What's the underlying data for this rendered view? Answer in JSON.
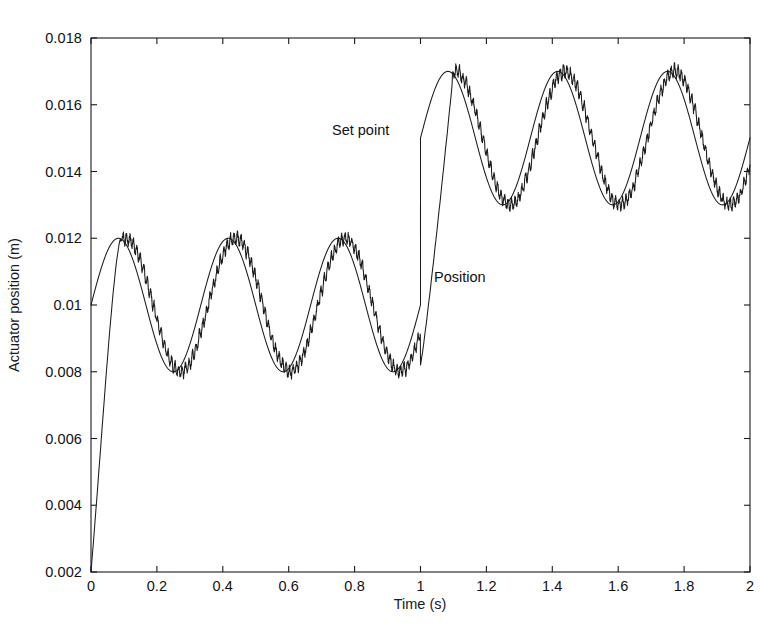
{
  "figure": {
    "background": "#ffffff",
    "ink_color": "#1a1a1a"
  },
  "axes": {
    "x_title": "Time (s)",
    "y_title": "Actuator position (m)",
    "x_ticks": [
      "0",
      "0.2",
      "0.4",
      "0.6",
      "0.8",
      "1",
      "1.2",
      "1.4",
      "1.6",
      "1.8",
      "2"
    ],
    "y_ticks": [
      "0.002",
      "0.004",
      "0.006",
      "0.008",
      "0.01",
      "0.012",
      "0.014",
      "0.016",
      "0.018"
    ]
  },
  "annotations": {
    "set_point": "Set point",
    "position": "Position"
  },
  "chart_data": {
    "type": "line",
    "title": "",
    "xlabel": "Time (s)",
    "ylabel": "Actuator position (m)",
    "xlim": [
      0,
      2
    ],
    "ylim": [
      0.002,
      0.018
    ],
    "xticks": [
      0,
      0.2,
      0.4,
      0.6,
      0.8,
      1,
      1.2,
      1.4,
      1.6,
      1.8,
      2
    ],
    "yticks": [
      0.002,
      0.004,
      0.006,
      0.008,
      0.01,
      0.012,
      0.014,
      0.016,
      0.018
    ],
    "grid": false,
    "legend": "none (curves labelled by in-plot text annotations)",
    "box": true,
    "series": [
      {
        "name": "Set point",
        "style": "smooth thin black line",
        "description": "Sinusoidal reference. For t<1 s: mean 0.010 m, amplitude 0.002 m (range 0.008-0.012 m). At t=1 s the reference steps up by 0.005 m: for t>=1 s mean 0.015 m, amplitude 0.002 m (range 0.013-0.017 m). Period 1/3 s (3 Hz), starts at 0.010 m rising.",
        "model": {
          "kind": "sine_with_step",
          "period_s": 0.3333,
          "amplitude_m": 0.002,
          "mean_before_step_m": 0.01,
          "mean_after_step_m": 0.015,
          "step_time_s": 1.0,
          "phase_rad": 0.0
        },
        "key_points": [
          {
            "t": 0.0,
            "y": 0.01
          },
          {
            "t": 0.083,
            "y": 0.012
          },
          {
            "t": 0.167,
            "y": 0.01
          },
          {
            "t": 0.25,
            "y": 0.008
          },
          {
            "t": 0.333,
            "y": 0.01
          },
          {
            "t": 0.417,
            "y": 0.012
          },
          {
            "t": 0.583,
            "y": 0.008
          },
          {
            "t": 0.75,
            "y": 0.012
          },
          {
            "t": 0.917,
            "y": 0.008
          },
          {
            "t": 0.999,
            "y": 0.01
          },
          {
            "t": 1.0,
            "y": 0.015
          },
          {
            "t": 1.083,
            "y": 0.017
          },
          {
            "t": 1.25,
            "y": 0.013
          },
          {
            "t": 1.417,
            "y": 0.017
          },
          {
            "t": 1.583,
            "y": 0.013
          },
          {
            "t": 1.75,
            "y": 0.017
          },
          {
            "t": 1.917,
            "y": 0.013
          },
          {
            "t": 2.0,
            "y": 0.015
          }
        ]
      },
      {
        "name": "Position",
        "style": "thin black line with high-frequency ripple (chattering)",
        "description": "Measured actuator position. Starts at 0.002 m at t=0, rises steeply to catch the reference by about t=0.09 s, then tracks the set point with a small phase lag and a superimposed high-frequency ripple of roughly +/-0.00025 m. After the step at t=1 s it ramps from about 0.008 m up to the new band, reaching the 0.017 m peak near t=1.10 s, then continues to track.",
        "model": {
          "kind": "lagged_sine_plus_chatter",
          "startup_rise_from_m": 0.002,
          "startup_settle_time_s": 0.09,
          "tracking_lag_s": 0.022,
          "chatter_amplitude_m": 0.00025,
          "chatter_frequency_hz": 95,
          "step_recovery_time_s": 0.1
        },
        "key_points": [
          {
            "t": 0.0,
            "y": 0.002
          },
          {
            "t": 0.02,
            "y": 0.0044
          },
          {
            "t": 0.05,
            "y": 0.0083
          },
          {
            "t": 0.08,
            "y": 0.011
          },
          {
            "t": 0.1,
            "y": 0.0125
          },
          {
            "t": 0.27,
            "y": 0.008
          },
          {
            "t": 0.43,
            "y": 0.0125
          },
          {
            "t": 0.6,
            "y": 0.008
          },
          {
            "t": 0.77,
            "y": 0.0125
          },
          {
            "t": 0.94,
            "y": 0.008
          },
          {
            "t": 1.0,
            "y": 0.0082
          },
          {
            "t": 1.1,
            "y": 0.0168
          },
          {
            "t": 1.27,
            "y": 0.013
          },
          {
            "t": 1.44,
            "y": 0.0172
          },
          {
            "t": 1.6,
            "y": 0.013
          },
          {
            "t": 1.77,
            "y": 0.0172
          },
          {
            "t": 1.93,
            "y": 0.013
          },
          {
            "t": 2.0,
            "y": 0.0148
          }
        ]
      }
    ]
  },
  "geometry": {
    "plot_left_px": 91,
    "plot_right_px": 750,
    "plot_top_px": 38,
    "plot_bottom_px": 572
  }
}
